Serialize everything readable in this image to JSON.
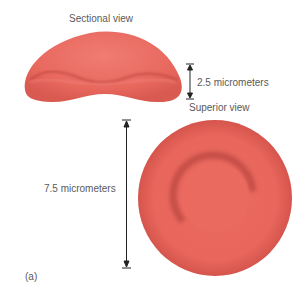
{
  "figure": {
    "panel_label": "(a)",
    "sectional_view": {
      "title": "Sectional view",
      "dimension_label": "2.5 micrometers"
    },
    "superior_view": {
      "title": "Superior view",
      "dimension_label": "7.5 micrometers"
    },
    "colors": {
      "cell_fill": "#e8685e",
      "cell_light": "#f07a70",
      "cell_shadow": "#a53833",
      "arrow": "#222222",
      "text": "#5a5a5a"
    }
  }
}
